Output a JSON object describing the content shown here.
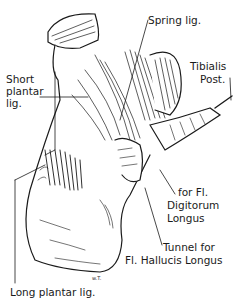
{
  "diagram": {
    "labels": {
      "spring_lig": "Spring lig.",
      "tibialis_post_1": "Tibialis",
      "tibialis_post_2": "Post.",
      "short_plantar_1": "Short",
      "short_plantar_2": "plantar",
      "short_plantar_3": "lig.",
      "fdl_1": "for Fl.",
      "fdl_2": "Digitorum",
      "fdl_3": "Longus",
      "tunnel_1": "Tunnel for",
      "tunnel_2": "Fl. Hallucis Longus",
      "long_plantar": "Long plantar lig.",
      "signature": "w.T."
    },
    "colors": {
      "ink": "#1a1a1a",
      "paper": "#ffffff"
    }
  }
}
